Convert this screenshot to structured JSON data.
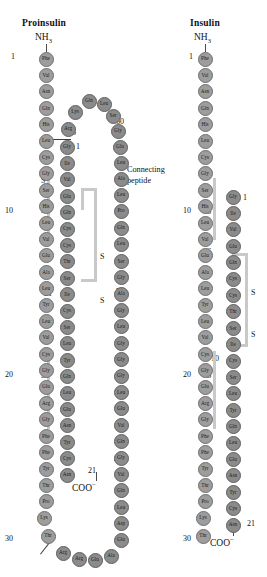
{
  "figure": {
    "type": "protein-sequence-diagram"
  },
  "panels": {
    "left": {
      "title": "Proinsulin",
      "n_terminus": "NH",
      "n_terminus_sub": "3",
      "c_terminus": "COO",
      "c_terminus_sup": "−",
      "annotation": "Connecting\npeptide",
      "annotation_line1": "Connecting",
      "annotation_line2": "peptide",
      "numbers": [
        "1",
        "10",
        "20",
        "30",
        "1",
        "21",
        "40",
        "50",
        "60",
        "65"
      ],
      "disulfide_labels": [
        "S",
        "S",
        "S",
        "S",
        "S",
        "S"
      ]
    },
    "right": {
      "title": "Insulin",
      "n_terminus": "NH",
      "n_terminus_sub": "3",
      "c_terminus": "COO",
      "c_terminus_sup": "−",
      "numbers": [
        "1",
        "10",
        "20",
        "30",
        "1",
        "10",
        "21"
      ],
      "disulfide_labels": [
        "S",
        "S",
        "S",
        "S"
      ]
    }
  },
  "colors": {
    "residue_fill": "#9d9d9d",
    "residue_fill_dark": "#8b8b8b",
    "residue_stroke": "#6e6e6e",
    "disulfide_bar": "#c9c9c9",
    "text": "#111111",
    "background": "#ffffff"
  },
  "chains": {
    "proinsulin_b_chain": {
      "label": "B chain",
      "residues": [
        "Phe",
        "Val",
        "Asn",
        "Gln",
        "His",
        "Leu",
        "Cys",
        "Gly",
        "Ser",
        "His",
        "Leu",
        "Val",
        "Glu",
        "Ala",
        "Leu",
        "Tyr",
        "Leu",
        "Val",
        "Cys",
        "Gly",
        "Glu",
        "Arg",
        "Gly",
        "Phe",
        "Phe",
        "Tyr",
        "Thr",
        "Pro",
        "Lys",
        "Thr"
      ],
      "start_number": 1,
      "markers": {
        "1": "1",
        "10": "10",
        "20": "20",
        "30": "30"
      }
    },
    "proinsulin_connecting_peptide": {
      "label": "C peptide",
      "residues": [
        "Arg",
        "Arg",
        "Glu",
        "Ala",
        "Glu",
        "Asp",
        "Leu",
        "Gln",
        "Val",
        "Gly",
        "Gln",
        "Val",
        "Glu",
        "Leu",
        "Gly",
        "Gly",
        "Gly",
        "Leu",
        "Gly",
        "Ala",
        "Gly",
        "Ser",
        "Leu",
        "Gln",
        "Pro",
        "Leu",
        "Ala",
        "Leu",
        "Glu",
        "Gly",
        "Ser",
        "Leu",
        "Gln",
        "Lys",
        "Arg"
      ],
      "markers": {
        "40": "40",
        "50": "50",
        "60": "60",
        "65": "65"
      }
    },
    "proinsulin_a_chain": {
      "label": "A chain",
      "residues": [
        "Gly",
        "Ile",
        "Val",
        "Glu",
        "Gln",
        "Cys",
        "Cys",
        "Thr",
        "Ser",
        "Ile",
        "Cys",
        "Ser",
        "Leu",
        "Tyr",
        "Gln",
        "Leu",
        "Glu",
        "Asn",
        "Tyr",
        "Cys",
        "Asn"
      ],
      "start_number": 1,
      "markers": {
        "1": "1",
        "10": "10",
        "21": "21"
      }
    },
    "insulin_b_chain": {
      "label": "B chain",
      "residues": [
        "Phe",
        "Val",
        "Asn",
        "Gln",
        "His",
        "Leu",
        "Cys",
        "Gly",
        "Ser",
        "His",
        "Leu",
        "Val",
        "Glu",
        "Ala",
        "Leu",
        "Tyr",
        "Leu",
        "Val",
        "Cys",
        "Gly",
        "Glu",
        "Arg",
        "Gly",
        "Phe",
        "Phe",
        "Tyr",
        "Thr",
        "Pro",
        "Lys",
        "Thr"
      ],
      "start_number": 1,
      "markers": {
        "1": "1",
        "10": "10",
        "20": "20",
        "30": "30"
      }
    },
    "insulin_a_chain": {
      "label": "A chain",
      "residues": [
        "Gly",
        "Ile",
        "Val",
        "Glu",
        "Gln",
        "Cys",
        "Cys",
        "Thr",
        "Ser",
        "Ile",
        "Cys",
        "Ser",
        "Leu",
        "Tyr",
        "Gln",
        "Leu",
        "Glu",
        "Asn",
        "Tyr",
        "Cys",
        "Asn"
      ],
      "start_number": 1,
      "markers": {
        "1": "1",
        "10": "10",
        "21": "21"
      }
    }
  }
}
